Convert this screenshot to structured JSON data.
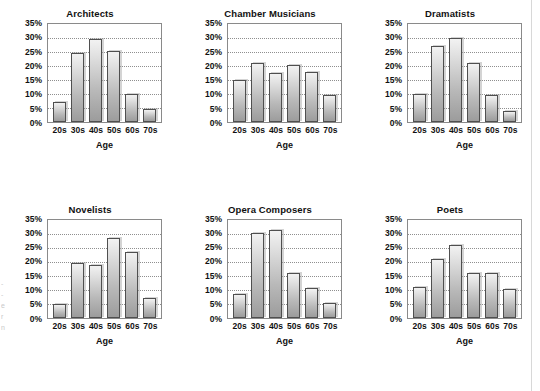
{
  "figure": {
    "background": "#ffffff",
    "bar_outline_color": "#4f4f4f",
    "gridline_color": "#8f8f8f",
    "frame_color": "#8a8a8a",
    "edge_caption": "-\n-\ne\nr\nn"
  },
  "chart_data": [
    {
      "type": "bar",
      "title": "Architects",
      "xlabel": "Age",
      "ylabel": "",
      "categories": [
        "20s",
        "30s",
        "40s",
        "50s",
        "60s",
        "70s"
      ],
      "values": [
        7,
        24.5,
        29.5,
        25.5,
        10,
        4.5
      ],
      "ylim": [
        0,
        35
      ],
      "yticks": [
        "0%",
        "5%",
        "10%",
        "15%",
        "20%",
        "25%",
        "30%",
        "35%"
      ],
      "ytick_values": [
        0,
        5,
        10,
        15,
        20,
        25,
        30,
        35
      ],
      "grid": true,
      "legend": "none"
    },
    {
      "type": "bar",
      "title": "Chamber Musicians",
      "xlabel": "Age",
      "ylabel": "",
      "categories": [
        "20s",
        "30s",
        "40s",
        "50s",
        "60s",
        "70s"
      ],
      "values": [
        15,
        21,
        17.5,
        20.5,
        18,
        9.5
      ],
      "ylim": [
        0,
        35
      ],
      "yticks": [
        "0%",
        "5%",
        "10%",
        "15%",
        "20%",
        "25%",
        "30%",
        "35%"
      ],
      "ytick_values": [
        0,
        5,
        10,
        15,
        20,
        25,
        30,
        35
      ],
      "grid": true,
      "legend": "none"
    },
    {
      "type": "bar",
      "title": "Dramatists",
      "xlabel": "Age",
      "ylabel": "",
      "categories": [
        "20s",
        "30s",
        "40s",
        "50s",
        "60s",
        "70s"
      ],
      "values": [
        10,
        27,
        30,
        21,
        9.8,
        4
      ],
      "ylim": [
        0,
        35
      ],
      "yticks": [
        "0%",
        "5%",
        "10%",
        "15%",
        "20%",
        "25%",
        "30%",
        "35%"
      ],
      "ytick_values": [
        0,
        5,
        10,
        15,
        20,
        25,
        30,
        35
      ],
      "grid": true,
      "legend": "none"
    },
    {
      "type": "bar",
      "title": "Novelists",
      "xlabel": "Age",
      "ylabel": "",
      "categories": [
        "20s",
        "30s",
        "40s",
        "50s",
        "60s",
        "70s"
      ],
      "values": [
        5,
        19.5,
        18.7,
        28.3,
        23.3,
        7
      ],
      "ylim": [
        0,
        35
      ],
      "yticks": [
        "0%",
        "5%",
        "10%",
        "15%",
        "20%",
        "25%",
        "30%",
        "35%"
      ],
      "ytick_values": [
        0,
        5,
        10,
        15,
        20,
        25,
        30,
        35
      ],
      "grid": true,
      "legend": "none"
    },
    {
      "type": "bar",
      "title": "Opera Composers",
      "xlabel": "Age",
      "ylabel": "",
      "categories": [
        "20s",
        "30s",
        "40s",
        "50s",
        "60s",
        "70s"
      ],
      "values": [
        8.3,
        30.2,
        31.3,
        16,
        10.5,
        5.2
      ],
      "ylim": [
        0,
        35
      ],
      "yticks": [
        "0%",
        "5%",
        "10%",
        "15%",
        "20%",
        "25%",
        "30%",
        "35%"
      ],
      "ytick_values": [
        0,
        5,
        10,
        15,
        20,
        25,
        30,
        35
      ],
      "grid": true,
      "legend": "none"
    },
    {
      "type": "bar",
      "title": "Poets",
      "xlabel": "Age",
      "ylabel": "",
      "categories": [
        "20s",
        "30s",
        "40s",
        "50s",
        "60s",
        "70s"
      ],
      "values": [
        10.8,
        21,
        26,
        16,
        16,
        10.3
      ],
      "ylim": [
        0,
        35
      ],
      "yticks": [
        "0%",
        "5%",
        "10%",
        "15%",
        "20%",
        "25%",
        "30%",
        "35%"
      ],
      "ytick_values": [
        0,
        5,
        10,
        15,
        20,
        25,
        30,
        35
      ],
      "grid": true,
      "legend": "none"
    }
  ]
}
